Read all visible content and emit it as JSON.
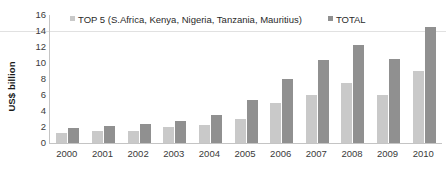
{
  "chart_data": {
    "type": "bar",
    "title": "",
    "subtitle": "",
    "xlabel": "",
    "ylabel": "US$ billion",
    "ylim": [
      0,
      16
    ],
    "yticks": [
      16,
      14,
      12,
      10,
      8,
      6,
      4,
      2,
      0
    ],
    "grid": false,
    "legend_position": "top",
    "categories": [
      "2000",
      "2001",
      "2002",
      "2003",
      "2004",
      "2005",
      "2006",
      "2007",
      "2008",
      "2009",
      "2010"
    ],
    "series": [
      {
        "name": "TOP 5 (S.Africa, Kenya, Nigeria, Tanzania, Mauritius)",
        "color": "#c9c9c9",
        "values": [
          1.2,
          1.5,
          1.5,
          2.0,
          2.2,
          3.0,
          5.0,
          6.0,
          7.5,
          6.0,
          9.0
        ]
      },
      {
        "name": "TOTAL",
        "color": "#909090",
        "values": [
          1.9,
          2.1,
          2.4,
          2.8,
          3.5,
          5.4,
          8.0,
          10.4,
          12.2,
          10.5,
          14.5
        ]
      }
    ]
  },
  "legend": {
    "items": [
      {
        "label": "TOP 5 (S.Africa, Kenya, Nigeria, Tanzania, Mauritius)",
        "color": "#c9c9c9"
      },
      {
        "label": "TOTAL",
        "color": "#909090"
      }
    ]
  },
  "axis": {
    "y_title": "US$ billion"
  },
  "colors": {
    "top5": "#c9c9c9",
    "total": "#909090",
    "axis": "#c4c4c4",
    "text": "#3a3a3a"
  }
}
